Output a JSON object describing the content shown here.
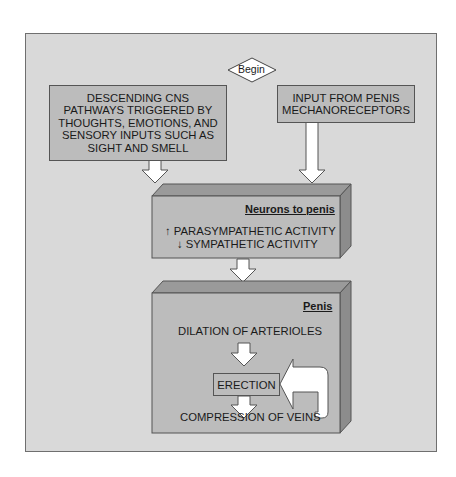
{
  "diagram": {
    "start_node": {
      "label": "Begin",
      "shape": "diamond"
    },
    "inputs": [
      {
        "id": "cns",
        "label": "DESCENDING CNS PATHWAYS TRIGGERED BY THOUGHTS, EMOTIONS, AND SENSORY INPUTS SUCH AS SIGHT AND SMELL",
        "lines": [
          "DESCENDING CNS",
          "PATHWAYS TRIGGERED BY",
          "THOUGHTS, EMOTIONS, AND",
          "SENSORY INPUTS SUCH AS",
          "SIGHT AND SMELL"
        ]
      },
      {
        "id": "mechano",
        "label": "INPUT FROM PENIS MECHANORECEPTORS",
        "lines": [
          "INPUT FROM PENIS",
          "MECHANORECEPTORS"
        ]
      }
    ],
    "neurons_box": {
      "title": "Neurons to penis",
      "items": [
        {
          "arrow": "up",
          "arrow_glyph": "↑",
          "text": "PARASYMPATHETIC ACTIVITY"
        },
        {
          "arrow": "down",
          "arrow_glyph": "↓",
          "text": "SYMPATHETIC ACTIVITY"
        }
      ]
    },
    "penis_box": {
      "title": "Penis",
      "step1": "DILATION OF ARTERIOLES",
      "result": "ERECTION",
      "step2": "COMPRESSION OF VEINS",
      "feedback": "positive feedback from COMPRESSION OF VEINS back to ERECTION"
    },
    "colors": {
      "panel_bg": "#d9d9d9",
      "box_fill": "#bcbcbc",
      "box_top": "#9a9a9a",
      "box_side": "#8c8c8c",
      "arrow_fill": "#ffffff",
      "outline": "#555555"
    }
  }
}
